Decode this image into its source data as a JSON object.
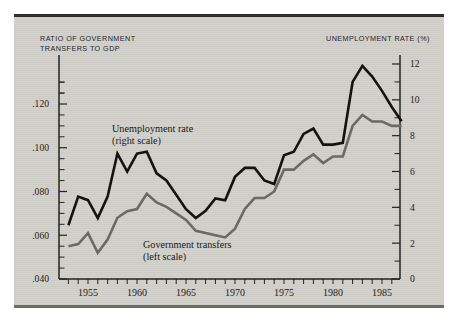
{
  "figure": {
    "background_color": "#d2d0cb",
    "top_rule_color": "#2c2b29"
  },
  "axes": {
    "left_title_line1": "RATIO OF GOVERNMENT",
    "left_title_line2": "TRANSFERS TO GDP",
    "right_title": "UNEMPLOYMENT RATE (%)",
    "left_ticks": [
      ".120",
      ".100",
      ".080",
      ".060",
      ".040"
    ],
    "right_ticks": [
      "12",
      "10",
      "8",
      "6",
      "4",
      "2",
      "0"
    ],
    "x_ticks": [
      "1955",
      "1960",
      "1965",
      "1970",
      "1975",
      "1980",
      "1985"
    ]
  },
  "annotations": {
    "unemployment_line1": "Unemployment rate",
    "unemployment_line2": "(right scale)",
    "transfers_line1": "Government transfers",
    "transfers_line2": "(left scale)"
  },
  "chart_data": {
    "type": "line",
    "title": "",
    "subtitle": "",
    "xlabel": "",
    "ylabel": "Ratio of government transfers to GDP",
    "y2label": "Unemployment rate (%)",
    "xlim": [
      1953,
      1987
    ],
    "ylim": [
      0.04,
      0.132
    ],
    "y2lim": [
      0,
      12.8
    ],
    "grid": false,
    "legend_position": "inline-annotations",
    "x": [
      1953,
      1954,
      1955,
      1956,
      1957,
      1958,
      1959,
      1960,
      1961,
      1962,
      1963,
      1964,
      1965,
      1966,
      1967,
      1968,
      1969,
      1970,
      1971,
      1972,
      1973,
      1974,
      1975,
      1976,
      1977,
      1978,
      1979,
      1980,
      1981,
      1982,
      1983,
      1984,
      1985,
      1986,
      1987
    ],
    "series": [
      {
        "name": "Unemployment rate (right scale)",
        "axis": "right",
        "units": "%",
        "color": "#141311",
        "values": [
          3.0,
          4.6,
          4.4,
          3.4,
          4.6,
          7.0,
          6.0,
          7.0,
          7.1,
          5.9,
          5.5,
          4.7,
          3.9,
          3.4,
          3.8,
          4.5,
          4.4,
          5.7,
          6.2,
          6.2,
          5.5,
          5.3,
          6.9,
          7.1,
          8.1,
          8.4,
          7.5,
          7.5,
          7.6,
          11.0,
          11.9,
          11.3,
          10.5,
          9.6,
          8.8
        ]
      },
      {
        "name": "Government transfers (left scale)",
        "axis": "left",
        "units": "ratio",
        "color": "#6b6a66",
        "values": [
          0.055,
          0.056,
          0.061,
          0.052,
          0.058,
          0.068,
          0.071,
          0.072,
          0.079,
          0.075,
          0.073,
          0.07,
          0.067,
          0.062,
          0.061,
          0.06,
          0.059,
          0.063,
          0.072,
          0.077,
          0.077,
          0.08,
          0.09,
          0.09,
          0.094,
          0.097,
          0.093,
          0.096,
          0.096,
          0.11,
          0.115,
          0.112,
          0.112,
          0.11,
          0.11
        ]
      }
    ]
  }
}
